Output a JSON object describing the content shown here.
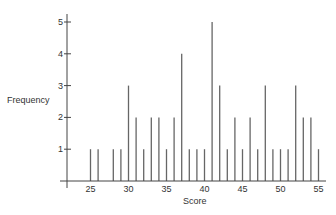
{
  "chart_data": {
    "type": "bar",
    "title": "",
    "xlabel": "Score",
    "ylabel": "Frequency",
    "x": [
      25,
      26,
      28,
      29,
      30,
      31,
      32,
      33,
      34,
      35,
      36,
      37,
      38,
      39,
      40,
      41,
      42,
      43,
      44,
      45,
      46,
      47,
      48,
      49,
      50,
      51,
      52,
      53,
      54,
      55
    ],
    "values": [
      1,
      1,
      1,
      1,
      3,
      2,
      1,
      2,
      2,
      1,
      2,
      4,
      1,
      1,
      1,
      5,
      3,
      1,
      2,
      1,
      2,
      1,
      3,
      1,
      1,
      1,
      3,
      2,
      2,
      1
    ],
    "xticks": [
      25,
      30,
      35,
      40,
      45,
      50,
      55
    ],
    "yticks": [
      1,
      2,
      3,
      4,
      5
    ],
    "xlim": [
      22,
      56
    ],
    "ylim": [
      0,
      5
    ],
    "grid": false,
    "legend": null,
    "bar_style": "thin vertical lines"
  },
  "colors": {
    "bar": "#666666",
    "axis": "#444444",
    "text": "#333333"
  }
}
